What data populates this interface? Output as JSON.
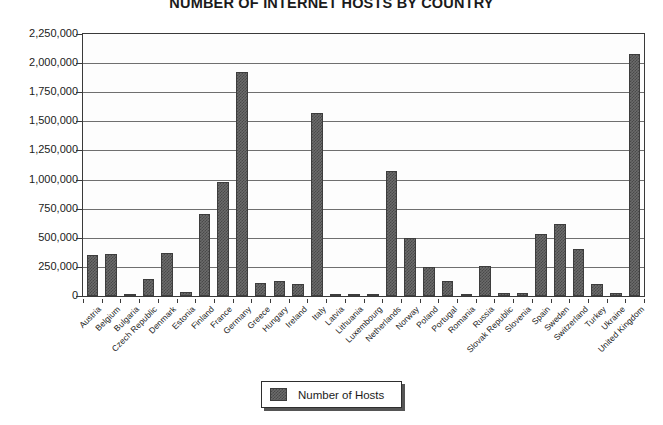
{
  "chart_data": {
    "type": "bar",
    "title": "NUMBER OF INTERNET HOSTS BY COUNTRY",
    "xlabel": "",
    "ylabel": "",
    "ylim": [
      0,
      2250000
    ],
    "ytick_step": 250000,
    "grid": true,
    "legend_position": "bottom-center",
    "series_name": "Number of Hosts",
    "ytick_labels": [
      "2,250,000",
      "2,000,000",
      "1,750,000",
      "1,500,000",
      "1,250,000",
      "1,000,000",
      "750,000",
      "500,000",
      "250,000",
      "0"
    ],
    "ytick_values": [
      2250000,
      2000000,
      1750000,
      1500000,
      1250000,
      1000000,
      750000,
      500000,
      250000,
      0
    ],
    "categories": [
      "Austria",
      "Belgium",
      "Bulgaria",
      "Czech Republic",
      "Denmark",
      "Estonia",
      "Finland",
      "France",
      "Germany",
      "Greece",
      "Hungary",
      "Ireland",
      "Italy",
      "Latvia",
      "Lithuania",
      "Luxembourg",
      "Netherlands",
      "Norway",
      "Poland",
      "Portugal",
      "Romania",
      "Russia",
      "Slovak Republic",
      "Slovenia",
      "Spain",
      "Sweden",
      "Switzerland",
      "Turkey",
      "Ukraine",
      "United Kingdom"
    ],
    "values": [
      355000,
      365000,
      15000,
      150000,
      370000,
      35000,
      705000,
      980000,
      1920000,
      110000,
      125000,
      100000,
      1570000,
      12000,
      10000,
      14000,
      1075000,
      495000,
      250000,
      125000,
      20000,
      255000,
      30000,
      25000,
      530000,
      615000,
      405000,
      105000,
      22000,
      2080000
    ],
    "series": [
      {
        "name": "Number of Hosts",
        "values": [
          355000,
          365000,
          15000,
          150000,
          370000,
          35000,
          705000,
          980000,
          1920000,
          110000,
          125000,
          100000,
          1570000,
          12000,
          10000,
          14000,
          1075000,
          495000,
          250000,
          125000,
          20000,
          255000,
          30000,
          25000,
          530000,
          615000,
          405000,
          105000,
          22000,
          2080000
        ]
      }
    ]
  },
  "legend": {
    "label": "Number of Hosts"
  },
  "colors": {
    "bar_fill": "#6b6b6b",
    "bar_pattern": "#494949",
    "bar_border": "#3d3d3d",
    "axis": "#3a3a3a",
    "gridline": "#6f6f6f",
    "text": "#1b1b1b",
    "plot_background": "#fdfdfd"
  }
}
